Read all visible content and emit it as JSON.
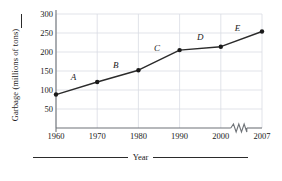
{
  "chart_data": {
    "type": "line",
    "title": "",
    "xlabel": "Year",
    "ylabel": "Garbage (millions of tons)",
    "x": [
      1960,
      1970,
      1980,
      1990,
      2000,
      2007
    ],
    "xtick_labels": [
      "1960",
      "1970",
      "1980",
      "1990",
      "2000",
      "2007"
    ],
    "values": [
      88,
      121,
      152,
      205,
      214,
      254
    ],
    "ytick_labels": [
      "50",
      "100",
      "150",
      "200",
      "250",
      "300"
    ],
    "yticks": [
      50,
      100,
      150,
      200,
      250,
      300
    ],
    "ylim": [
      0,
      300
    ],
    "xlim": [
      1955,
      2010
    ],
    "grid": true,
    "legend": "none",
    "axis_break": {
      "present": true,
      "between": [
        "2000",
        "2007"
      ],
      "symbol": "zigzag"
    },
    "segment_labels": [
      {
        "label": "A",
        "from": 1960,
        "to": 1970
      },
      {
        "label": "B",
        "from": 1970,
        "to": 1980
      },
      {
        "label": "C",
        "from": 1980,
        "to": 1990
      },
      {
        "label": "D",
        "from": 1990,
        "to": 2000
      },
      {
        "label": "E",
        "from": 2000,
        "to": 2007
      }
    ],
    "colors": {
      "line": "#2b2b2b",
      "marker": "#1a1a1a",
      "grid": "#d9dce3",
      "axis": "#6f7378",
      "background": "#ffffff"
    }
  }
}
